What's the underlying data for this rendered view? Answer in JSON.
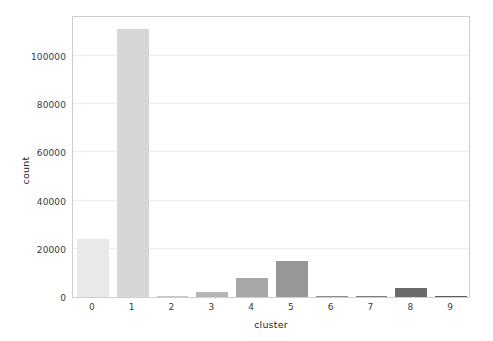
{
  "chart_data": {
    "type": "bar",
    "title": "",
    "xlabel": "cluster",
    "ylabel": "count",
    "categories": [
      "0",
      "1",
      "2",
      "3",
      "4",
      "5",
      "6",
      "7",
      "8",
      "9"
    ],
    "values": [
      24000,
      111000,
      200,
      2000,
      8000,
      15000,
      150,
      100,
      3700,
      600
    ],
    "bar_colors": [
      "#e9e9e9",
      "#d6d6d6",
      "#c4c4c4",
      "#b5b5b5",
      "#a8a8a8",
      "#979797",
      "#8c8c8c",
      "#7e7e7e",
      "#6b6b6b",
      "#5e5e5e"
    ],
    "ylim": [
      0,
      117000
    ],
    "yticks": [
      0,
      20000,
      40000,
      60000,
      80000,
      100000
    ],
    "ytick_labels": [
      "0",
      "20000",
      "40000",
      "60000",
      "80000",
      "100000"
    ],
    "xtick_labels": [
      "0",
      "1",
      "2",
      "3",
      "4",
      "5",
      "6",
      "7",
      "8",
      "9"
    ],
    "grid": true,
    "grid_axis": "y",
    "legend": null,
    "legend_position": "none",
    "frame_color": "#cfcfcf",
    "grid_color": "#ebebeb",
    "background": "#ffffff"
  }
}
